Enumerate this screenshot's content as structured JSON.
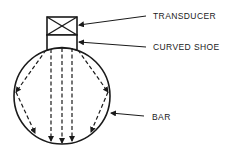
{
  "labels": {
    "transducer": "TRANSDUCER",
    "curved_shoe": "CURVED SHOE",
    "bar": "BAR"
  },
  "colors": {
    "stroke": "#1a1a1a",
    "background": "#ffffff"
  }
}
